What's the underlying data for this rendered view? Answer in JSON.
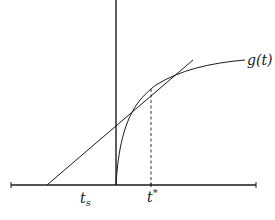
{
  "diagram": {
    "type": "function-plot-with-tangent",
    "colors": {
      "stroke": "#1a1a1a",
      "background": "#ffffff"
    },
    "labels": {
      "curve": "g(t)",
      "ts_base": "t",
      "ts_sub": "s",
      "tstar_base": "t",
      "tstar_sup": "*"
    },
    "elements": {
      "horizontal_axis": "time axis",
      "vertical_axis": "value axis",
      "curve": "concave increasing curve g(t) starting at origin",
      "tangent": "tangent line to g(t) at t*, intersecting time axis at t_s",
      "dashed_line": "vertical dashed line from tangent point down to t*"
    }
  }
}
